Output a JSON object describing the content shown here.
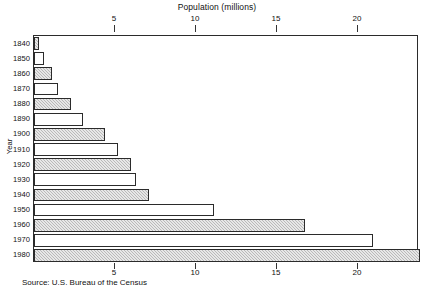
{
  "chart_data": {
    "type": "bar",
    "orientation": "horizontal",
    "title": "",
    "xlabel": "Population (millions)",
    "ylabel": "Year",
    "xlim": [
      0,
      23.8
    ],
    "grid": false,
    "legend": null,
    "xticks": [
      5,
      10,
      15,
      20
    ],
    "xtick_labels": [
      "5",
      "10",
      "15",
      "20"
    ],
    "categories": [
      "1840",
      "1850",
      "1860",
      "1870",
      "1880",
      "1890",
      "1900",
      "1910",
      "1920",
      "1930",
      "1940",
      "1950",
      "1960",
      "1970",
      "1980"
    ],
    "values": [
      0.3,
      0.6,
      1.1,
      1.5,
      2.3,
      3.0,
      4.4,
      5.2,
      6.0,
      6.3,
      7.1,
      11.1,
      16.7,
      20.9,
      23.8
    ],
    "fills": [
      "hatched",
      "plain",
      "hatched",
      "plain",
      "hatched",
      "plain",
      "hatched",
      "plain",
      "hatched",
      "plain",
      "hatched",
      "plain",
      "hatched",
      "plain",
      "hatched"
    ],
    "annotations": [
      "Source: U.S. Bureau of the Census"
    ]
  },
  "axis": {
    "top_title": "Population (millions)",
    "y_title": "Year"
  },
  "source": {
    "text": "Source: U.S. Bureau of the Census"
  }
}
